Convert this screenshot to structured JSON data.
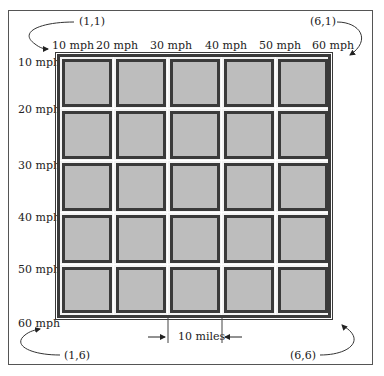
{
  "diagram": {
    "type": "grid-map",
    "rows": 5,
    "columns": 5,
    "top_axis_labels": [
      "10 mph",
      "20 mph",
      "30 mph",
      "40 mph",
      "50 mph",
      "60 mph"
    ],
    "left_axis_labels": [
      "10 mph",
      "20 mph",
      "30 mph",
      "40 mph",
      "50 mph",
      "60 mph"
    ],
    "corner_labels": {
      "top_left": "(1,1)",
      "top_right": "(6,1)",
      "bottom_left": "(1,6)",
      "bottom_right": "(6,6)"
    },
    "scale_label": "10 miles",
    "colors": {
      "cell_fill": "#bdbdbd",
      "cell_border": "#3a3a3a",
      "gridline": "#ffffff",
      "frame": "#555555"
    }
  }
}
